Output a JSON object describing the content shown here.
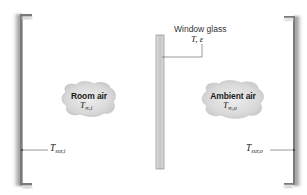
{
  "diagram": {
    "window": {
      "label": "Window glass",
      "properties": "T, ε"
    },
    "inside": {
      "cloud_label": "Room air",
      "temperature": {
        "symbol": "T",
        "subscript": "∞,i"
      },
      "surroundings": {
        "symbol": "T",
        "subscript": "sur,i"
      }
    },
    "outside": {
      "cloud_label": "Ambient air",
      "temperature": {
        "symbol": "T",
        "subscript": "∞,o"
      },
      "surroundings": {
        "symbol": "T",
        "subscript": "sur,o"
      }
    }
  },
  "colors": {
    "wall": "#8a8a8a",
    "wall_shadow": "#c8c8c8",
    "glass": "#d4d4d4",
    "glass_edge": "#9a9a9a",
    "cloud": "#d9d9d9",
    "line": "#555555"
  }
}
